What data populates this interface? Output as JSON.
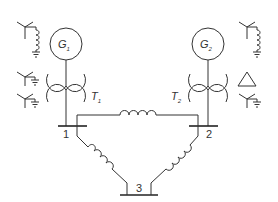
{
  "diagram": {
    "type": "power-system-one-line",
    "generators": [
      {
        "id": "G1",
        "label": "G",
        "subscript": "1",
        "grounding": "wye-grounded-through-reactor"
      },
      {
        "id": "G2",
        "label": "G",
        "subscript": "2",
        "grounding": "wye-grounded-through-reactor"
      }
    ],
    "transformers": [
      {
        "id": "T1",
        "label": "T",
        "subscript": "1",
        "primary": "wye-grounded",
        "secondary": "wye-grounded"
      },
      {
        "id": "T2",
        "label": "T",
        "subscript": "2",
        "primary": "delta",
        "secondary": "wye-grounded"
      }
    ],
    "buses": [
      {
        "id": "1",
        "label": "1"
      },
      {
        "id": "2",
        "label": "2"
      },
      {
        "id": "3",
        "label": "3"
      }
    ],
    "lines": [
      {
        "from": "1",
        "to": "2",
        "element": "inductor"
      },
      {
        "from": "1",
        "to": "3",
        "element": "inductor"
      },
      {
        "from": "2",
        "to": "3",
        "element": "inductor"
      }
    ],
    "colors": {
      "stroke": "#333333",
      "background": "#ffffff"
    }
  }
}
